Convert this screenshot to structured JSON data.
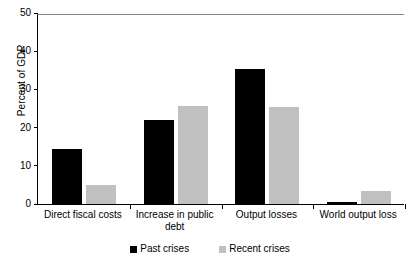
{
  "chart_data": {
    "type": "bar",
    "title": "",
    "subtitle": "",
    "xlabel": "",
    "ylabel": "Percent of GDP",
    "ylim": [
      0,
      50
    ],
    "ytick_values": [
      0,
      10,
      20,
      30,
      40,
      50
    ],
    "ytick_labels": [
      "0",
      "10",
      "20",
      "30",
      "40",
      "50"
    ],
    "grid": false,
    "legend_position": "bottom-center",
    "categories": [
      "Direct fiscal costs",
      "Increase in public\ndebt",
      "Output losses",
      "World output loss"
    ],
    "series": [
      {
        "name": "Past crises",
        "color": "#000000",
        "values": [
          14.5,
          22.0,
          35.3,
          0.5
        ]
      },
      {
        "name": "Recent crises",
        "color": "#c0c0c0",
        "values": [
          5.0,
          25.7,
          25.3,
          3.3
        ]
      }
    ]
  },
  "axis": {
    "y_title": "Percent of GDP"
  },
  "legend": {
    "items": [
      {
        "label": "Past crises",
        "swatch": "black-square-swatch"
      },
      {
        "label": "Recent crises",
        "swatch": "gray-square-swatch"
      }
    ]
  }
}
